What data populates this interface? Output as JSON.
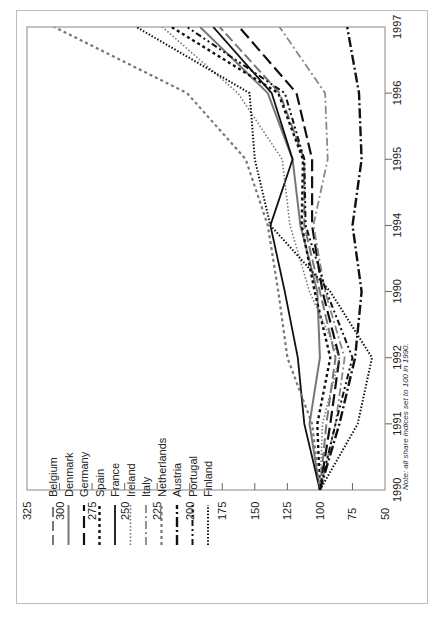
{
  "chart_data": {
    "type": "line",
    "orientation": "rotated-90-ccw",
    "title": "",
    "xlabel": "",
    "ylabel": "",
    "x": [
      "1990",
      "1991",
      "1992",
      "1990",
      "1994",
      "1995",
      "1996",
      "1997"
    ],
    "x_tick_labels": [
      "1990",
      "1991",
      "1992",
      "1990",
      "1994",
      "1995",
      "1996",
      "1997"
    ],
    "y_ticks": [
      50,
      75,
      100,
      125,
      150,
      175,
      200,
      225,
      250,
      275,
      300,
      325
    ],
    "ylim": [
      50,
      325
    ],
    "grid": false,
    "legend_position": "upper-left (rotated)",
    "note": "Note: all share indices set to 100 in 1990.",
    "series": [
      {
        "name": "Belgium",
        "color": "#777777",
        "dash": "10,4",
        "width": 2.0,
        "values": [
          100,
          95,
          88,
          100,
          112,
          112,
          131,
          177
        ]
      },
      {
        "name": "Denmark",
        "color": "#777777",
        "dash": "",
        "width": 2.0,
        "values": [
          100,
          108,
          100,
          102,
          115,
          121,
          140,
          192
        ]
      },
      {
        "name": "Germany",
        "color": "#111111",
        "dash": "12,5",
        "width": 2.2,
        "values": [
          100,
          92,
          85,
          98,
          106,
          106,
          118,
          162
        ]
      },
      {
        "name": "Spain",
        "color": "#111111",
        "dash": "3,3",
        "width": 2.4,
        "values": [
          100,
          102,
          92,
          104,
          114,
          113,
          132,
          214
        ]
      },
      {
        "name": "France",
        "color": "#111111",
        "dash": "",
        "width": 1.8,
        "values": [
          100,
          112,
          117,
          127,
          138,
          121,
          137,
          182
        ]
      },
      {
        "name": "Ireland",
        "color": "#777777",
        "dash": "1.5,2",
        "width": 1.6,
        "values": [
          100,
          98,
          85,
          108,
          123,
          129,
          163,
          221
        ]
      },
      {
        "name": "Italy",
        "color": "#888888",
        "dash": "8,3,2,3",
        "width": 1.8,
        "values": [
          100,
          88,
          81,
          96,
          105,
          94,
          96,
          131
        ]
      },
      {
        "name": "Netherlands",
        "color": "#777777",
        "dash": "3,3",
        "width": 2.2,
        "values": [
          100,
          106,
          125,
          132,
          140,
          157,
          202,
          304
        ]
      },
      {
        "name": "Austria",
        "color": "#111111",
        "dash": "10,3,2,3",
        "width": 2.4,
        "values": [
          100,
          85,
          73,
          68,
          75,
          68,
          70,
          79
        ]
      },
      {
        "name": "Portugal",
        "color": "#111111",
        "dash": "6,3,2,3,2,3",
        "width": 2.0,
        "values": [
          100,
          88,
          75,
          95,
          111,
          112,
          127,
          202
        ]
      },
      {
        "name": "Finland",
        "color": "#111111",
        "dash": "1.5,1.8",
        "width": 2.0,
        "values": [
          100,
          71,
          60,
          92,
          138,
          150,
          154,
          241
        ]
      }
    ]
  }
}
